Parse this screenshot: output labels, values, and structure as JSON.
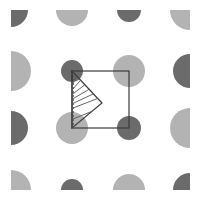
{
  "diagram": {
    "colors": {
      "background": "#ffffff",
      "dark_atom": "#6b6b6b",
      "light_atom": "#b3b3b3",
      "line": "#3a3a3a",
      "hatch": "#555555"
    },
    "clip": {
      "x": 11,
      "y": 10,
      "width": 179,
      "height": 180
    },
    "lattice": {
      "columns_x": [
        11,
        72,
        129,
        190
      ],
      "rows_y": [
        10,
        71,
        128,
        190
      ],
      "atoms": [
        {
          "row": 0,
          "col": 0,
          "type": "dark",
          "r": 17
        },
        {
          "row": 0,
          "col": 1,
          "type": "light",
          "r": 16
        },
        {
          "row": 0,
          "col": 2,
          "type": "dark",
          "r": 12
        },
        {
          "row": 0,
          "col": 3,
          "type": "light",
          "r": 20
        },
        {
          "row": 1,
          "col": 0,
          "type": "light",
          "r": 20
        },
        {
          "row": 1,
          "col": 1,
          "type": "dark",
          "r": 11
        },
        {
          "row": 1,
          "col": 2,
          "type": "light",
          "r": 16
        },
        {
          "row": 1,
          "col": 3,
          "type": "dark",
          "r": 17
        },
        {
          "row": 2,
          "col": 0,
          "type": "dark",
          "r": 17
        },
        {
          "row": 2,
          "col": 1,
          "type": "light",
          "r": 16
        },
        {
          "row": 2,
          "col": 2,
          "type": "dark",
          "r": 12
        },
        {
          "row": 2,
          "col": 3,
          "type": "light",
          "r": 20
        },
        {
          "row": 3,
          "col": 0,
          "type": "light",
          "r": 20
        },
        {
          "row": 3,
          "col": 1,
          "type": "dark",
          "r": 11
        },
        {
          "row": 3,
          "col": 2,
          "type": "light",
          "r": 16
        },
        {
          "row": 3,
          "col": 3,
          "type": "dark",
          "r": 17
        }
      ]
    },
    "unit_cell": {
      "x1": 72,
      "y1": 71,
      "x2": 129,
      "y2": 128
    },
    "wedge": {
      "points": [
        [
          72,
          71
        ],
        [
          102,
          103
        ],
        [
          72,
          128
        ]
      ],
      "hatch_count": 6
    }
  }
}
